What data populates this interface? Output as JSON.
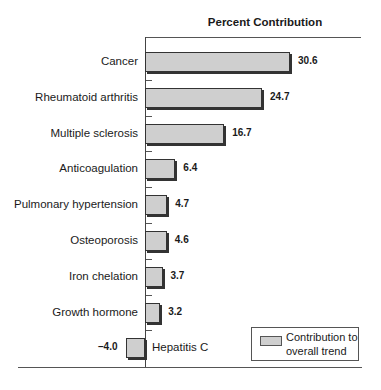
{
  "chart_data": {
    "type": "bar",
    "orientation": "horizontal",
    "title": "Percent Contribution",
    "xlabel": "",
    "ylabel": "",
    "categories": [
      "Cancer",
      "Rheumatoid arthritis",
      "Multiple sclerosis",
      "Anticoagulation",
      "Pulmonary hypertension",
      "Osteoporosis",
      "Iron chelation",
      "Growth hormone",
      "Hepatitis C"
    ],
    "values": [
      30.6,
      24.7,
      16.7,
      6.4,
      4.7,
      4.6,
      3.7,
      3.2,
      -4.0
    ],
    "value_labels": [
      "30.6",
      "24.7",
      "16.7",
      "6.4",
      "4.7",
      "4.6",
      "3.7",
      "3.2",
      "–4.0"
    ],
    "legend": [
      "Contribution to overall trend"
    ],
    "legend_position": "bottom-right",
    "grid": false,
    "bar_color": "#cfcfcf"
  },
  "legend": {
    "line1": "Contribution to",
    "line2": "overall trend"
  }
}
